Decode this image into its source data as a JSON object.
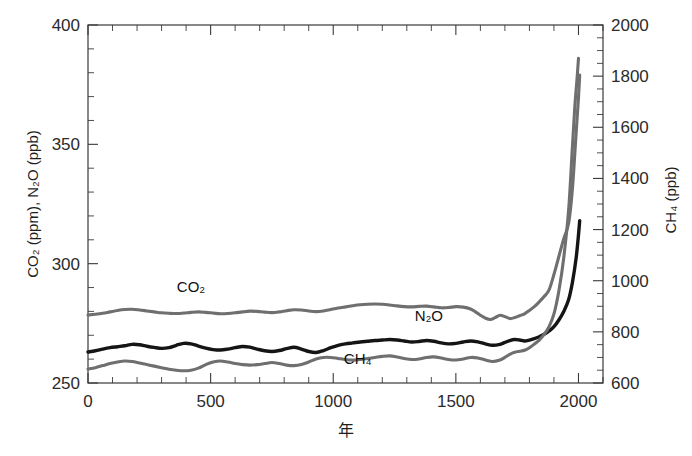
{
  "chart_data": {
    "type": "line",
    "title": "",
    "xlabel": "年",
    "ylabel_left": "CO₂ (ppm), N₂O (ppb)",
    "ylabel_right": "CH₄ (ppb)",
    "xlim": [
      0,
      2100
    ],
    "ylim_left": [
      250,
      400
    ],
    "ylim_right": [
      600,
      2000
    ],
    "xticks": [
      0,
      500,
      1000,
      1500,
      2000
    ],
    "xticklabels": [
      "0",
      "500",
      "1000",
      "1500",
      "2000"
    ],
    "xtick_minor_step": 100,
    "yticks_left": [
      250,
      300,
      350,
      400
    ],
    "yticklabels_left": [
      "250",
      "300",
      "350",
      "400"
    ],
    "ytick_minor_step": 10,
    "yticks_right": [
      600,
      800,
      1000,
      1200,
      1400,
      1600,
      1800,
      2000
    ],
    "yticklabels_right": [
      "600",
      "800",
      "1000",
      "1200",
      "1400",
      "1600",
      "1800",
      "2000"
    ],
    "ytick_right_minor_step": 50,
    "grid": false,
    "legend": "inline-annotations",
    "annotations": [
      {
        "text": "CO₂",
        "x": 420,
        "y": 288,
        "axis": "left"
      },
      {
        "text": "N₂O",
        "x": 1390,
        "y": 276,
        "axis": "left"
      },
      {
        "text": "CH₄",
        "x": 1100,
        "y": 258,
        "axis": "left"
      }
    ],
    "series": [
      {
        "name": "CO₂",
        "unit": "ppm",
        "axis": "left",
        "color": "#6f6f6f",
        "style": "gray",
        "x": [
          0,
          30,
          60,
          90,
          120,
          150,
          180,
          210,
          240,
          270,
          300,
          330,
          360,
          390,
          420,
          450,
          480,
          510,
          540,
          570,
          600,
          630,
          660,
          690,
          720,
          750,
          780,
          810,
          840,
          870,
          900,
          930,
          960,
          990,
          1020,
          1050,
          1080,
          1110,
          1140,
          1170,
          1200,
          1230,
          1260,
          1290,
          1320,
          1350,
          1380,
          1410,
          1440,
          1470,
          1500,
          1530,
          1560,
          1580,
          1600,
          1620,
          1640,
          1660,
          1680,
          1700,
          1720,
          1740,
          1760,
          1780,
          1800,
          1820,
          1840,
          1860,
          1880,
          1900,
          1920,
          1940,
          1960,
          1975,
          1990,
          2000,
          2005
        ],
        "y": [
          278.5,
          278.8,
          279.2,
          279.8,
          280.4,
          280.8,
          280.9,
          280.6,
          280.2,
          279.8,
          279.4,
          279.2,
          279.1,
          279.3,
          279.6,
          279.8,
          279.6,
          279.3,
          279.0,
          279.1,
          279.4,
          279.8,
          280.1,
          280.0,
          279.7,
          279.5,
          279.8,
          280.3,
          280.7,
          280.6,
          280.2,
          279.9,
          280.2,
          280.8,
          281.4,
          281.9,
          282.4,
          282.8,
          283.0,
          283.1,
          283.0,
          282.7,
          282.3,
          282.0,
          281.9,
          282.1,
          282.2,
          281.9,
          281.5,
          281.6,
          282.0,
          281.8,
          281.0,
          279.8,
          278.4,
          277.2,
          276.6,
          277.4,
          278.4,
          277.8,
          277.0,
          277.4,
          278.2,
          279.0,
          280.4,
          282.0,
          284.0,
          286.2,
          289.0,
          295.5,
          303.0,
          310.5,
          317.0,
          331.0,
          354.0,
          369.5,
          379.0
        ]
      },
      {
        "name": "N₂O",
        "unit": "ppb",
        "axis": "left",
        "color": "#151515",
        "style": "black",
        "x": [
          0,
          30,
          60,
          90,
          120,
          150,
          180,
          210,
          240,
          270,
          300,
          330,
          360,
          390,
          420,
          450,
          480,
          510,
          540,
          570,
          600,
          630,
          660,
          690,
          720,
          750,
          780,
          810,
          840,
          870,
          900,
          930,
          960,
          990,
          1020,
          1050,
          1080,
          1110,
          1140,
          1170,
          1200,
          1230,
          1260,
          1290,
          1320,
          1350,
          1380,
          1410,
          1440,
          1470,
          1500,
          1530,
          1560,
          1590,
          1620,
          1650,
          1680,
          1700,
          1720,
          1740,
          1760,
          1780,
          1800,
          1820,
          1840,
          1860,
          1880,
          1900,
          1920,
          1940,
          1960,
          1975,
          1990,
          2000,
          2005
        ],
        "y": [
          263.0,
          263.5,
          264.2,
          264.8,
          265.2,
          265.6,
          266.2,
          266.0,
          265.4,
          264.9,
          264.5,
          264.8,
          265.8,
          266.6,
          266.4,
          265.5,
          264.6,
          264.0,
          263.8,
          264.2,
          264.8,
          265.3,
          265.0,
          264.2,
          263.5,
          263.2,
          263.6,
          264.4,
          265.0,
          264.2,
          263.2,
          262.8,
          263.6,
          264.8,
          265.8,
          266.4,
          266.8,
          267.2,
          267.5,
          267.8,
          268.0,
          268.2,
          268.0,
          267.6,
          267.2,
          267.4,
          267.8,
          267.5,
          266.8,
          266.4,
          266.6,
          267.2,
          267.6,
          267.2,
          266.4,
          265.8,
          266.2,
          267.0,
          267.8,
          268.2,
          268.0,
          267.6,
          268.0,
          268.6,
          269.4,
          270.4,
          271.8,
          273.6,
          276.4,
          280.0,
          285.0,
          292.0,
          302.0,
          312.0,
          318.0
        ]
      },
      {
        "name": "CH₄",
        "unit": "ppb",
        "axis": "right",
        "color": "#6f6f6f",
        "style": "gray",
        "x": [
          0,
          30,
          60,
          90,
          120,
          150,
          180,
          210,
          240,
          270,
          300,
          330,
          360,
          390,
          420,
          450,
          480,
          510,
          540,
          570,
          600,
          630,
          660,
          690,
          720,
          750,
          780,
          810,
          840,
          870,
          900,
          930,
          960,
          990,
          1020,
          1050,
          1080,
          1110,
          1140,
          1170,
          1200,
          1230,
          1260,
          1290,
          1320,
          1350,
          1380,
          1410,
          1440,
          1470,
          1500,
          1530,
          1560,
          1590,
          1620,
          1650,
          1680,
          1700,
          1720,
          1740,
          1760,
          1780,
          1800,
          1820,
          1840,
          1860,
          1880,
          1900,
          1920,
          1940,
          1960,
          1975,
          1985,
          1995,
          2000
        ],
        "y": [
          655,
          660,
          668,
          676,
          682,
          686,
          684,
          678,
          672,
          666,
          660,
          654,
          650,
          648,
          650,
          658,
          672,
          682,
          686,
          682,
          676,
          672,
          670,
          672,
          676,
          680,
          676,
          670,
          668,
          672,
          682,
          694,
          700,
          700,
          696,
          692,
          690,
          692,
          696,
          700,
          704,
          706,
          702,
          696,
          692,
          694,
          700,
          702,
          698,
          692,
          690,
          694,
          700,
          698,
          690,
          684,
          690,
          700,
          712,
          720,
          724,
          728,
          738,
          752,
          768,
          790,
          820,
          870,
          960,
          1090,
          1280,
          1520,
          1680,
          1800,
          1870
        ]
      }
    ]
  },
  "axes": {
    "left_title": "CO₂ (ppm), N₂O (ppb)",
    "right_title": "CH₄ (ppb)",
    "bottom_title": "年"
  },
  "labels": {
    "co2": "CO₂",
    "n2o": "N₂O",
    "ch4": "CH₄"
  }
}
